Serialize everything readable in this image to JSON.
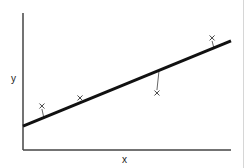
{
  "chart_data": {
    "type": "scatter",
    "title": "",
    "xlabel": "x",
    "ylabel": "y",
    "xlim": [
      0,
      10
    ],
    "ylim": [
      0,
      10
    ],
    "grid": false,
    "legend": null,
    "points": [
      {
        "x": 0.91,
        "y": 3.21
      },
      {
        "x": 2.74,
        "y": 3.8
      },
      {
        "x": 6.44,
        "y": 4.16
      },
      {
        "x": 9.09,
        "y": 8.18
      }
    ],
    "regression_line": {
      "x0": 0,
      "y0": 1.75,
      "x1": 10,
      "y1": 7.96
    },
    "residuals_shown": true,
    "marker": "x",
    "annotations": []
  },
  "colors": {
    "axis": "#444444",
    "line": "#111111",
    "marker": "#444444",
    "residual": "#666666",
    "frame_edge": "#d6d6d6"
  }
}
